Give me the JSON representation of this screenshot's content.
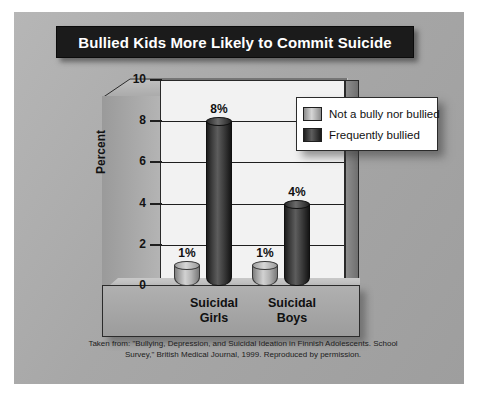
{
  "title": "Bullied Kids More Likely to Commit Suicide",
  "chart_data": {
    "type": "bar",
    "title": "Bullied Kids More Likely to Commit Suicide",
    "xlabel": "",
    "ylabel": "Percent",
    "ylim": [
      0,
      10
    ],
    "yticks": [
      "0",
      "2",
      "4",
      "6",
      "8",
      "10"
    ],
    "grid": true,
    "legend_position": "top-right",
    "categories": [
      "Suicidal Girls",
      "Suicidal Boys"
    ],
    "category_lines": [
      [
        "Suicidal",
        "Girls"
      ],
      [
        "Suicidal",
        "Boys"
      ]
    ],
    "series": [
      {
        "name": "Not a bully nor bullied",
        "values": [
          1,
          1
        ],
        "labels": [
          "1%",
          "1%"
        ],
        "color": "#c8c8c8"
      },
      {
        "name": "Frequently bullied",
        "values": [
          8,
          4
        ],
        "labels": [
          "8%",
          "4%"
        ],
        "color": "#2b2b2b"
      }
    ]
  },
  "legend": {
    "items": [
      {
        "label": "Not a bully nor bullied",
        "swatch": "light"
      },
      {
        "label": "Frequently bullied",
        "swatch": "dark"
      }
    ]
  },
  "footnote": {
    "line1": "Taken from: \"Bullying, Depression, and Suicidal Ideation in Finnish Adolescents. School",
    "line2": "Survey,\" British Medical Journal, 1999. Reproduced by permission."
  },
  "colors": {
    "panel": "#a9a9a9",
    "title_bar": "#1b1b1b",
    "title_text": "#ffffff",
    "plot_background": "#f2f2f2",
    "axis": "#1f1f1f"
  }
}
